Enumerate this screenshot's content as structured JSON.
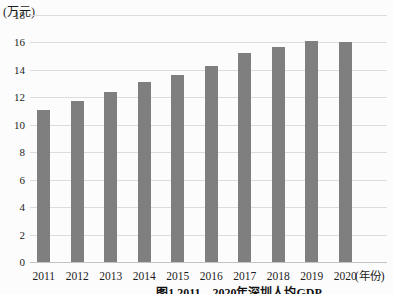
{
  "chart_data": {
    "type": "bar",
    "title": "图1 2011—2020年深圳人均GDP",
    "categories": [
      "2011",
      "2012",
      "2013",
      "2014",
      "2015",
      "2016",
      "2017",
      "2018",
      "2019",
      "2020"
    ],
    "values": [
      11.1,
      11.7,
      12.4,
      13.1,
      13.6,
      14.3,
      15.2,
      15.7,
      16.1,
      16.0
    ],
    "ylabel": "(万元)",
    "xlabel": "(年份)",
    "ylim": [
      0,
      18
    ],
    "ytick_step": 2,
    "grid": true,
    "legend": "none",
    "bar_color": "#7f7f7f",
    "grid_color": "#dcdcdc",
    "axis_color": "#c3c3c3",
    "caption_note": "caption partially cut off at bottom edge"
  }
}
